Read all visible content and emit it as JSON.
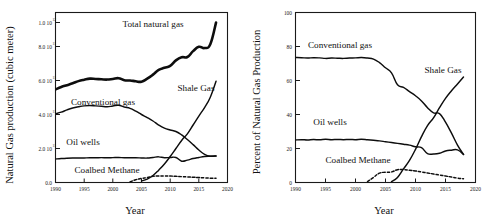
{
  "figure": {
    "title": "",
    "panels": [
      "left",
      "right"
    ]
  },
  "left_panel": {
    "ylabel": "Natural Gas production (cubic meter)",
    "xlabel": "Year",
    "ytick_labels": [
      "0.0",
      "2.0 10",
      "4.0 10",
      "6.0 10",
      "8.0 10",
      "1.0 10"
    ],
    "ytick_exponents": [
      "",
      "11",
      "11",
      "11",
      "11",
      "12"
    ],
    "xtick_labels": [
      "1990",
      "1995",
      "2000",
      "2005",
      "2010",
      "2015",
      "2020"
    ],
    "series_labels": {
      "total": "Total natural gas",
      "conventional": "Conventional gas",
      "shale": "Shale Gas",
      "oil_wells": "Oil wells",
      "coalbed": "Coalbed Methane"
    }
  },
  "right_panel": {
    "ylabel": "Percent of Natural Gas Production",
    "xlabel": "Year",
    "ytick_labels": [
      "0",
      "20",
      "40",
      "60",
      "80",
      "100"
    ],
    "xtick_labels": [
      "1990",
      "1995",
      "2000",
      "2005",
      "2010",
      "2015",
      "2020"
    ],
    "series_labels": {
      "conventional": "Conventional gas",
      "shale": "Shale Gas",
      "oil_wells": "Oil wells",
      "coalbed": "Coalbed Methane"
    }
  },
  "colors": {
    "ink": "#0d0d0d",
    "axis": "#1a1a1a",
    "background": "#ffffff"
  },
  "chart_data": [
    {
      "type": "line",
      "id": "left",
      "title": "",
      "xlabel": "Year",
      "ylabel": "Natural Gas production (cubic meter)",
      "xlim": [
        1990,
        2020
      ],
      "ylim": [
        0,
        1100000000000.0
      ],
      "xticks": [
        1990,
        1995,
        2000,
        2005,
        2010,
        2015,
        2020
      ],
      "yticks": [
        0,
        200000000000.0,
        400000000000.0,
        600000000000.0,
        800000000000.0,
        1000000000000.0
      ],
      "grid": false,
      "legend": "inline-labels",
      "x": [
        1990,
        1991,
        1992,
        1993,
        1994,
        1995,
        1996,
        1997,
        1998,
        1999,
        2000,
        2001,
        2002,
        2003,
        2004,
        2005,
        2006,
        2007,
        2008,
        2009,
        2010,
        2011,
        2012,
        2013,
        2014,
        2015,
        2016,
        2017,
        2018
      ],
      "series": [
        {
          "name": "Total natural gas",
          "style": "thick-solid",
          "values": [
            602000000000.0,
            618000000000.0,
            630000000000.0,
            642000000000.0,
            656000000000.0,
            665000000000.0,
            672000000000.0,
            670000000000.0,
            668000000000.0,
            666000000000.0,
            670000000000.0,
            675000000000.0,
            662000000000.0,
            660000000000.0,
            655000000000.0,
            652000000000.0,
            672000000000.0,
            698000000000.0,
            728000000000.0,
            742000000000.0,
            755000000000.0,
            790000000000.0,
            810000000000.0,
            812000000000.0,
            850000000000.0,
            878000000000.0,
            870000000000.0,
            895000000000.0,
            1035000000000.0
          ]
        },
        {
          "name": "Conventional gas",
          "style": "thin-solid",
          "values": [
            445000000000.0,
            455000000000.0,
            470000000000.0,
            482000000000.0,
            490000000000.0,
            496000000000.0,
            498000000000.0,
            496000000000.0,
            493000000000.0,
            490000000000.0,
            495000000000.0,
            500000000000.0,
            488000000000.0,
            480000000000.0,
            462000000000.0,
            440000000000.0,
            420000000000.0,
            398000000000.0,
            372000000000.0,
            352000000000.0,
            340000000000.0,
            330000000000.0,
            308000000000.0,
            278000000000.0,
            245000000000.0,
            210000000000.0,
            182000000000.0,
            170000000000.0,
            172000000000.0
          ]
        },
        {
          "name": "Shale Gas",
          "style": "thin-solid",
          "values": [
            0,
            0,
            0,
            0,
            0,
            0,
            0,
            0,
            0,
            0,
            0,
            0,
            0,
            0,
            0,
            10000000000.0,
            22000000000.0,
            45000000000.0,
            80000000000.0,
            120000000000.0,
            168000000000.0,
            220000000000.0,
            272000000000.0,
            315000000000.0,
            372000000000.0,
            430000000000.0,
            485000000000.0,
            552000000000.0,
            655000000000.0
          ]
        },
        {
          "name": "Oil wells",
          "style": "thin-solid",
          "values": [
            152000000000.0,
            155000000000.0,
            157000000000.0,
            158000000000.0,
            158000000000.0,
            159000000000.0,
            160000000000.0,
            160000000000.0,
            161000000000.0,
            160000000000.0,
            161000000000.0,
            162000000000.0,
            160000000000.0,
            160000000000.0,
            160000000000.0,
            159000000000.0,
            158000000000.0,
            162000000000.0,
            166000000000.0,
            160000000000.0,
            162000000000.0,
            162000000000.0,
            138000000000.0,
            145000000000.0,
            155000000000.0,
            162000000000.0,
            168000000000.0,
            170000000000.0,
            172000000000.0
          ]
        },
        {
          "name": "Coalbed Methane",
          "style": "dashed",
          "values": [
            0,
            0,
            0,
            0,
            0,
            0,
            0,
            0,
            0,
            0,
            0,
            0,
            0,
            4000000000.0,
            18000000000.0,
            26000000000.0,
            32000000000.0,
            40000000000.0,
            42000000000.0,
            42000000000.0,
            42000000000.0,
            40000000000.0,
            38000000000.0,
            36000000000.0,
            34000000000.0,
            32000000000.0,
            30000000000.0,
            28000000000.0,
            27000000000.0
          ]
        }
      ]
    },
    {
      "type": "line",
      "id": "right",
      "title": "",
      "xlabel": "Year",
      "ylabel": "Percent of Natural Gas Production",
      "xlim": [
        1990,
        2020
      ],
      "ylim": [
        0,
        100
      ],
      "xticks": [
        1990,
        1995,
        2000,
        2005,
        2010,
        2015,
        2020
      ],
      "yticks": [
        0,
        20,
        40,
        60,
        80,
        100
      ],
      "grid": false,
      "legend": "inline-labels",
      "x": [
        1990,
        1991,
        1992,
        1993,
        1994,
        1995,
        1996,
        1997,
        1998,
        1999,
        2000,
        2001,
        2002,
        2003,
        2004,
        2005,
        2006,
        2007,
        2008,
        2009,
        2010,
        2011,
        2012,
        2013,
        2014,
        2015,
        2016,
        2017,
        2018
      ],
      "series": [
        {
          "name": "Conventional gas",
          "style": "thin-solid",
          "values": [
            73.5,
            73.4,
            73.2,
            73.4,
            73.3,
            73.0,
            73.2,
            73.1,
            73.0,
            73.2,
            73.3,
            73.5,
            73.2,
            72.6,
            70.5,
            67.5,
            64.5,
            57.5,
            56.0,
            53.5,
            51.0,
            48.0,
            44.0,
            41.0,
            40.5,
            35.5,
            29.0,
            22.0,
            16.5
          ]
        },
        {
          "name": "Oil wells",
          "style": "thin-solid",
          "values": [
            25.0,
            25.2,
            25.0,
            25.3,
            25.1,
            25.4,
            25.2,
            25.3,
            25.2,
            25.3,
            25.2,
            25.4,
            25.1,
            24.8,
            24.5,
            24.0,
            23.5,
            23.0,
            22.5,
            22.0,
            21.0,
            20.5,
            17.0,
            16.8,
            17.2,
            18.5,
            19.0,
            19.2,
            16.5
          ]
        },
        {
          "name": "Shale Gas",
          "style": "thin-solid",
          "values": [
            0,
            0,
            0,
            0,
            0,
            0,
            0,
            0,
            0,
            0,
            0,
            0,
            0,
            0,
            0,
            0,
            0.5,
            3.0,
            8.0,
            13.0,
            19.5,
            27.0,
            33.5,
            38.0,
            44.0,
            49.5,
            54.0,
            58.0,
            62.0
          ]
        },
        {
          "name": "Coalbed Methane",
          "style": "dashed",
          "values": [
            0,
            0,
            0,
            0,
            0,
            0,
            0,
            0,
            0,
            0,
            0,
            0,
            0.5,
            3.0,
            5.5,
            6.0,
            6.2,
            7.5,
            7.6,
            7.2,
            6.8,
            6.2,
            5.6,
            5.0,
            4.4,
            3.8,
            3.2,
            2.6,
            2.2
          ]
        }
      ]
    }
  ]
}
